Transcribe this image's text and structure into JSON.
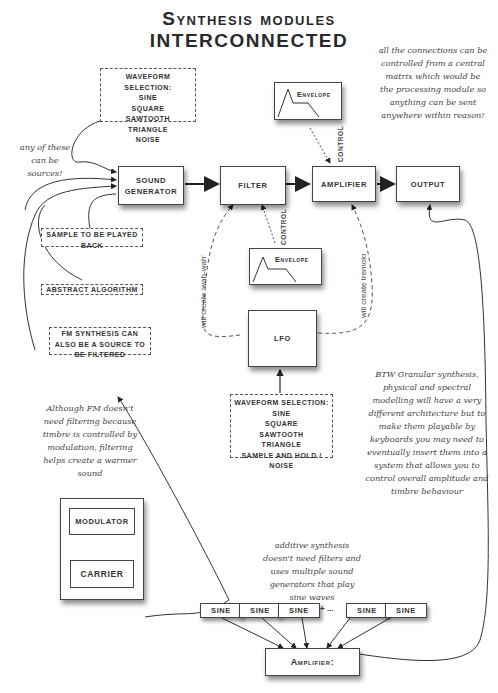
{
  "title": {
    "line1": "Synthesis modules",
    "line2": "interconnected"
  },
  "main_chain": {
    "sound_generator": "SOUND GENERATOR",
    "filter": "FILTER",
    "amplifier": "AMPLIFIER",
    "output": "OUTPUT"
  },
  "envelope_top": {
    "label": "Envelope",
    "control_label": "CONTROL"
  },
  "envelope_mid": {
    "label": "Envelope",
    "control_label": "CONTROL"
  },
  "lfo": {
    "label": "LFO",
    "left_note": "will create 'wah-wah'",
    "right_note": "will create tremolo"
  },
  "waveform_top": {
    "header": "WAVEFORM SELECTION:",
    "options": [
      "SINE",
      "SQUARE",
      "SAWTOOTH",
      "TRIANGLE",
      "NOISE"
    ]
  },
  "waveform_lfo": {
    "header": "WAVEFORM SELECTION:",
    "options": [
      "SINE",
      "SQUARE",
      "SAWTOOTH",
      "TRIANGLE",
      "SAMPLE AND HOLD /",
      "NOISE"
    ]
  },
  "sources": {
    "note": "any of these can be sources!",
    "sample": "SAMPLE TO BE PLAYED BACK",
    "algorithm": "ABSTRACT ALGORITHM",
    "fm": "FM SYNTHESIS CAN ALSO BE A SOURCE TO BE FILTERED"
  },
  "notes": {
    "matrix": "all the connections can be controlled from a central matrix which would be the processing module so anything can be sent anywhere within reason!",
    "granular": "BTW Granular synthesis, physical and spectral modelling will have a very different architecture but to make them playable by keyboards you may need to eventually insert them into a system that allows you to control overall amplitude and timbre behaviour",
    "fm": "Although FM doesn't need filtering because timbre is controlled by modulation, filtering helps create a warmer sound",
    "additive": "additive synthesis doesn't need filters and uses multiple sound generators that play sine waves"
  },
  "fm_block": {
    "modulator": "MODULATOR",
    "carrier": "CARRIER"
  },
  "additive": {
    "sines": [
      "SINE",
      "SINE",
      "SINE",
      "SINE",
      "SINE"
    ],
    "ellipsis": "+ ...",
    "amplifier": "Amplifier:"
  }
}
